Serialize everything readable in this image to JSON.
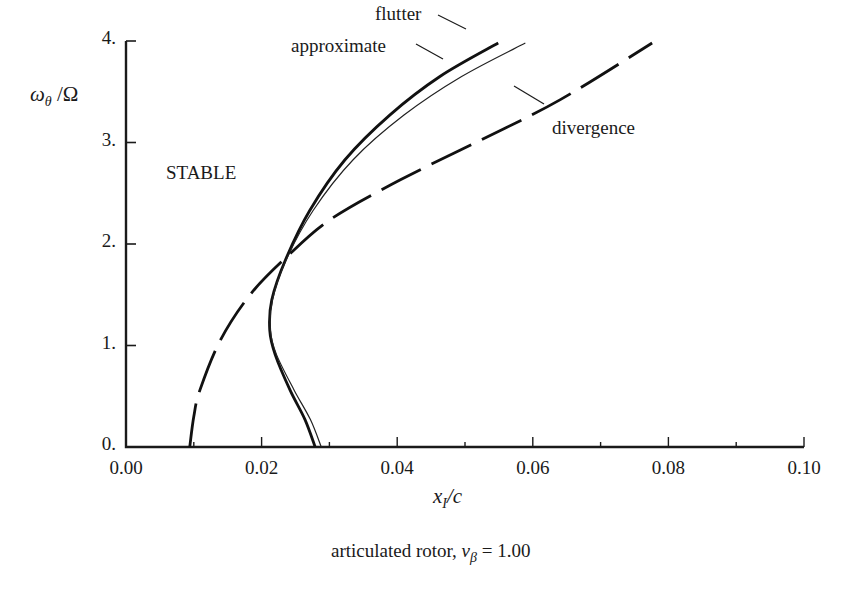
{
  "chart_data": {
    "type": "line",
    "title": "",
    "caption": "articulated rotor, ν_β = 1.00",
    "caption_parts": {
      "prefix": "articulated rotor, ",
      "symbol": "ν",
      "subscript": "β",
      "suffix": " = 1.00"
    },
    "xlabel": "x_I/c",
    "ylabel": "ω_θ/Ω",
    "xlim": [
      0.0,
      0.1
    ],
    "ylim": [
      0.0,
      4.0
    ],
    "x_ticks": [
      "0.00",
      "0.02",
      "0.04",
      "0.06",
      "0.08",
      "0.10"
    ],
    "x_tick_values": [
      0.0,
      0.02,
      0.04,
      0.06,
      0.08,
      0.1
    ],
    "x_minor_ticks": [
      0.01,
      0.03,
      0.05,
      0.07,
      0.09
    ],
    "y_ticks": [
      "0.",
      "1.",
      "2.",
      "3.",
      "4."
    ],
    "y_tick_values": [
      0,
      1,
      2,
      3,
      4
    ],
    "grid": false,
    "region_label": "STABLE",
    "series": [
      {
        "name": "flutter",
        "style": "solid-thick",
        "x": [
          0.0279,
          0.0264,
          0.0242,
          0.022,
          0.0212,
          0.0215,
          0.0235,
          0.0271,
          0.0323,
          0.0389,
          0.0463,
          0.0549
        ],
        "y": [
          0.0,
          0.27,
          0.56,
          0.91,
          1.15,
          1.45,
          1.84,
          2.33,
          2.83,
          3.27,
          3.65,
          3.98
        ]
      },
      {
        "name": "approximate",
        "style": "solid-thin",
        "x": [
          0.0288,
          0.0272,
          0.0248,
          0.0222,
          0.0213,
          0.0216,
          0.0236,
          0.0276,
          0.0335,
          0.041,
          0.0495,
          0.0589
        ],
        "y": [
          0.0,
          0.27,
          0.56,
          0.91,
          1.15,
          1.45,
          1.84,
          2.33,
          2.83,
          3.27,
          3.65,
          3.98
        ]
      },
      {
        "name": "divergence",
        "style": "long-dash",
        "x": [
          0.0094,
          0.01,
          0.0109,
          0.0139,
          0.0183,
          0.0235,
          0.0301,
          0.0404,
          0.0522,
          0.064,
          0.0776
        ],
        "y": [
          0.0,
          0.3,
          0.56,
          1.05,
          1.5,
          1.86,
          2.24,
          2.63,
          3.02,
          3.42,
          3.98
        ]
      }
    ],
    "annotations": [
      {
        "text": "flutter",
        "target": "flutter"
      },
      {
        "text": "approximate",
        "target": "approximate"
      },
      {
        "text": "divergence",
        "target": "divergence"
      }
    ]
  },
  "labels": {
    "ylabel_omega": "ω",
    "ylabel_sub": "θ",
    "ylabel_rest": " /Ω",
    "xlabel_x": "x",
    "xlabel_sub": "I",
    "xlabel_rest": "/c",
    "stable": "STABLE",
    "flutter": "flutter",
    "approximate": "approximate",
    "divergence": "divergence"
  }
}
